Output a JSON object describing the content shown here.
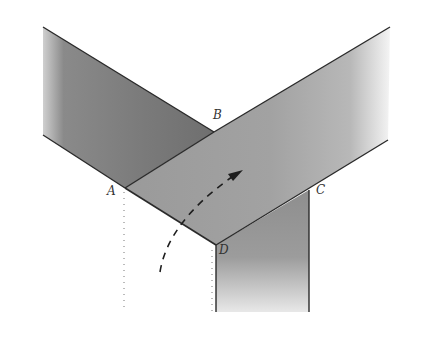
{
  "diagram": {
    "type": "folded-strip-illustration",
    "labels": {
      "A": "A",
      "B": "B",
      "C": "C",
      "D": "D"
    },
    "points": {
      "A": [
        125,
        188
      ],
      "B": [
        214,
        132
      ],
      "C": [
        309,
        190
      ],
      "D": [
        216,
        245
      ]
    },
    "arrow": "dashed curved arrow indicating folding direction",
    "colors": {
      "strip_dark": "#7e7e7e",
      "strip_mid": "#969696",
      "strip_light": "#a9a9a9",
      "edge": "#2a2a2a",
      "background": "#ffffff"
    }
  }
}
